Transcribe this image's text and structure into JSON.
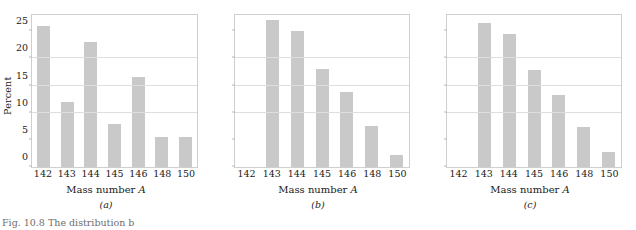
{
  "figure": {
    "caption_fragment": "Fig. 10.8   The distribution b",
    "axis": {
      "ylabel": "Percent",
      "xlabel_text": "Mass number ",
      "xlabel_symbol": "A",
      "yticks": [
        0,
        5,
        10,
        15,
        20,
        25
      ],
      "ymin": 0,
      "ymax": 28,
      "gridlines": [
        10,
        15,
        20
      ]
    }
  },
  "chart_data": [
    {
      "type": "bar",
      "title": "(a)",
      "panel": "a",
      "xlabel": "Mass number A",
      "ylabel": "Percent",
      "categories": [
        "142",
        "143",
        "144",
        "145",
        "146",
        "148",
        "150"
      ],
      "values": [
        26.0,
        12.0,
        23.0,
        8.0,
        16.5,
        5.5,
        5.5
      ],
      "ylim": [
        0,
        28
      ],
      "grid": true,
      "legend": "none"
    },
    {
      "type": "bar",
      "title": "(b)",
      "panel": "b",
      "xlabel": "Mass number A",
      "ylabel": "Percent",
      "categories": [
        "142",
        "143",
        "144",
        "145",
        "146",
        "148",
        "150"
      ],
      "values": [
        0,
        27.0,
        25.0,
        18.0,
        13.8,
        7.5,
        2.3
      ],
      "ylim": [
        0,
        28
      ],
      "grid": true,
      "legend": "none"
    },
    {
      "type": "bar",
      "title": "(c)",
      "panel": "c",
      "xlabel": "Mass number A",
      "ylabel": "Percent",
      "categories": [
        "142",
        "143",
        "144",
        "145",
        "146",
        "148",
        "150"
      ],
      "values": [
        0,
        26.5,
        24.5,
        17.8,
        13.3,
        7.3,
        2.8
      ],
      "ylim": [
        0,
        28
      ],
      "grid": true,
      "legend": "none"
    }
  ],
  "style": {
    "bar_color": "#c9c9c9",
    "frame_color": "#cfcfcf",
    "grid_color": "#dedede",
    "text_color": "#1a1a1a",
    "background": "#ffffff"
  }
}
